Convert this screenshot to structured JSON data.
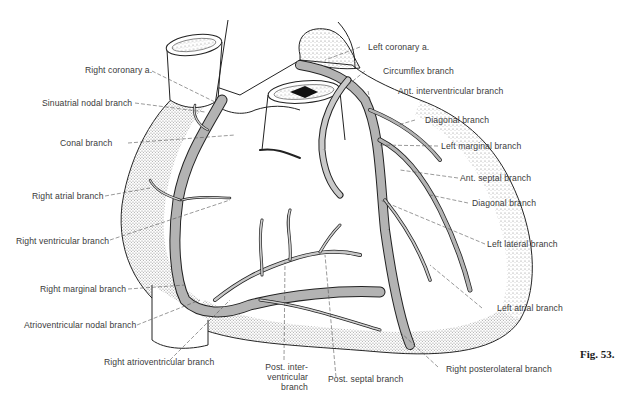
{
  "figure": {
    "number_label": "Fig. 53.",
    "colors": {
      "vessel_fill": "#b3b3b3",
      "outline": "#222222",
      "stipple": "#8a8a8a",
      "label_text": "#3a3a3a",
      "leader_line": "#555555"
    }
  },
  "labels": {
    "left_side": [
      {
        "id": "right-coronary-a",
        "text": "Right coronary a."
      },
      {
        "id": "sinuatrial-nodal-branch",
        "text": "Sinuatrial nodal branch"
      },
      {
        "id": "conal-branch",
        "text": "Conal branch"
      },
      {
        "id": "right-atrial-branch",
        "text": "Right atrial branch"
      },
      {
        "id": "right-ventricular-branch",
        "text": "Right ventricular branch"
      },
      {
        "id": "right-marginal-branch",
        "text": "Right marginal branch"
      },
      {
        "id": "atrioventricular-nodal-branch",
        "text": "Atrioventricular nodal branch"
      }
    ],
    "right_side": [
      {
        "id": "left-coronary-a",
        "text": "Left coronary a."
      },
      {
        "id": "circumflex-branch",
        "text": "Circumflex branch"
      },
      {
        "id": "ant-interventricular-branch",
        "text": "Ant. interventricular branch"
      },
      {
        "id": "diagonal-branch-1",
        "text": "Diagonal branch"
      },
      {
        "id": "left-marginal-branch",
        "text": "Left marginal branch"
      },
      {
        "id": "ant-septal-branch",
        "text": "Ant. septal branch"
      },
      {
        "id": "diagonal-branch-2",
        "text": "Diagonal branch"
      },
      {
        "id": "left-lateral-branch",
        "text": "Left lateral branch"
      },
      {
        "id": "left-atrial-branch",
        "text": "Left atrial branch"
      }
    ],
    "bottom": [
      {
        "id": "right-atrioventricular-branch",
        "text": "Right atrioventricular branch"
      },
      {
        "id": "post-interventricular-branch",
        "text": "Post. inter- ventricular branch"
      },
      {
        "id": "post-septal-branch",
        "text": "Post. septal branch"
      },
      {
        "id": "right-posterolateral-branch",
        "text": "Right posterolateral branch"
      }
    ]
  }
}
